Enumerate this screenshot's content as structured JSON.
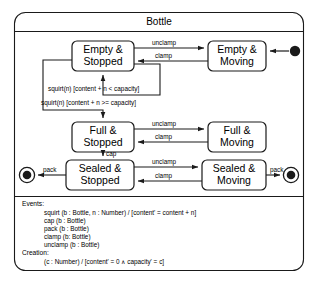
{
  "diagram": {
    "title": "Bottle",
    "type": "uml-state-machine",
    "states": [
      {
        "id": "empty-stopped",
        "label_line1": "Empty &",
        "label_line2": "Stopped"
      },
      {
        "id": "empty-moving",
        "label_line1": "Empty &",
        "label_line2": "Moving"
      },
      {
        "id": "full-stopped",
        "label_line1": "Full &",
        "label_line2": "Stopped"
      },
      {
        "id": "full-moving",
        "label_line1": "Full &",
        "label_line2": "Moving"
      },
      {
        "id": "sealed-stopped",
        "label_line1": "Sealed &",
        "label_line2": "Stopped"
      },
      {
        "id": "sealed-moving",
        "label_line1": "Sealed &",
        "label_line2": "Moving"
      }
    ],
    "transitions": {
      "empty_unclamp": "unclamp",
      "empty_clamp": "clamp",
      "full_unclamp": "unclamp",
      "full_clamp": "clamp",
      "sealed_unclamp": "unclamp",
      "sealed_clamp": "clamp",
      "squirt_self": "squirt(n) [content + n < capacity]",
      "squirt_full": "squirt(n) [content + n >= capacity]",
      "cap": "cap",
      "pack_left": "pack",
      "pack_right": "pack"
    },
    "notes": {
      "events_heading": "Events:",
      "events": [
        "squirt (b : Bottle, n : Number) / [content' = content + n]",
        "cap (b : Bottle)",
        "pack (b : Bottle)",
        "clamp (b: Bottle)",
        "unclamp (b : Bottle)"
      ],
      "creation_heading": "Creation:",
      "creation": [
        "(c : Number) / [content' = 0 ∧ capacity' = c]"
      ]
    },
    "pseudostates": {
      "initial": "initial-state",
      "final_left": "final-state",
      "final_right": "final-state"
    },
    "colors": {
      "stroke": "#1a1a1a",
      "background": "#ffffff",
      "text": "#000000"
    }
  }
}
